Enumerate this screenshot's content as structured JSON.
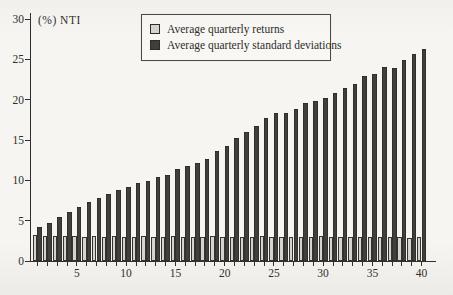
{
  "figure": {
    "axis_label": "(%) NTI",
    "background_color": "#f6f5f1",
    "ink_color": "#2f2e2c"
  },
  "legend": {
    "items": [
      {
        "label": "Average quarterly returns",
        "swatch_color": "#d6d4ce"
      },
      {
        "label": "Average quarterly standard deviations",
        "swatch_color": "#403f3c"
      }
    ]
  },
  "chart_data": {
    "type": "bar",
    "title": "",
    "xlabel": "",
    "ylabel": "(%) NTI",
    "xlim": [
      0,
      41
    ],
    "ylim": [
      0,
      30
    ],
    "grid": false,
    "legend_position": "top-center",
    "x": [
      1,
      2,
      3,
      4,
      5,
      6,
      7,
      8,
      9,
      10,
      11,
      12,
      13,
      14,
      15,
      16,
      17,
      18,
      19,
      20,
      21,
      22,
      23,
      24,
      25,
      26,
      27,
      28,
      29,
      30,
      31,
      32,
      33,
      34,
      35,
      36,
      37,
      38,
      39,
      40
    ],
    "xticks": [
      5,
      10,
      15,
      20,
      25,
      30,
      35,
      40
    ],
    "yticks": [
      0,
      5,
      10,
      15,
      20,
      25,
      30
    ],
    "series": [
      {
        "name": "Average quarterly returns",
        "color": "#d6d4ce",
        "border_color": "#35342f",
        "values": [
          3.2,
          3.1,
          3.1,
          3.1,
          3.1,
          3.0,
          3.1,
          3.0,
          3.1,
          3.0,
          3.0,
          3.1,
          3.0,
          3.0,
          3.1,
          3.0,
          3.0,
          3.0,
          3.1,
          3.0,
          3.0,
          3.0,
          3.0,
          3.1,
          3.0,
          3.0,
          3.0,
          3.0,
          3.0,
          3.1,
          3.0,
          3.0,
          3.0,
          3.0,
          3.0,
          3.0,
          3.0,
          3.0,
          2.9,
          3.0
        ]
      },
      {
        "name": "Average quarterly standard deviations",
        "color": "#403f3c",
        "border_color": "#232220",
        "values": [
          4.2,
          4.7,
          5.5,
          6.1,
          6.7,
          7.3,
          7.8,
          8.3,
          8.8,
          9.2,
          9.7,
          9.9,
          10.4,
          10.7,
          11.4,
          11.8,
          12.2,
          12.7,
          13.6,
          14.3,
          15.2,
          16.0,
          16.7,
          17.7,
          18.4,
          18.3,
          18.8,
          19.6,
          19.9,
          20.2,
          20.8,
          21.4,
          22.0,
          22.9,
          23.2,
          24.0,
          23.9,
          24.9,
          25.7,
          26.3
        ]
      }
    ]
  }
}
